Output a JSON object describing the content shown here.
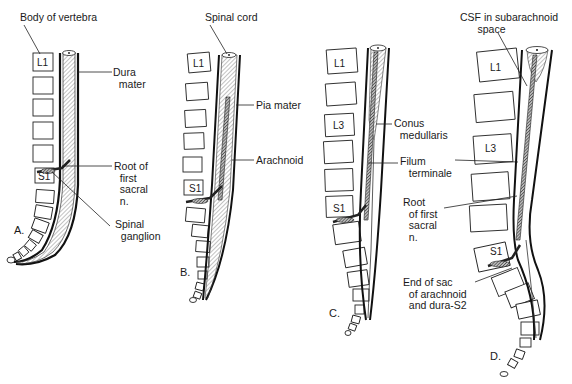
{
  "figure": {
    "panels": [
      {
        "id": "A",
        "letter": "A.",
        "labels": {
          "body_of_vertebra": "Body of vertebra",
          "dura_mater": "Dura\n  mater",
          "root_first_sacral": "Root of\n  first\n  sacral\n  n.",
          "spinal_ganglion": "Spinal\n  ganglion"
        },
        "vertebrae": {
          "top": "L1",
          "sacral": "S1"
        }
      },
      {
        "id": "B",
        "letter": "B.",
        "labels": {
          "spinal_cord": "Spinal cord",
          "pia_mater": "Pia mater",
          "arachnoid": "Arachnoid"
        },
        "vertebrae": {
          "top": "L1",
          "sacral": "S1"
        }
      },
      {
        "id": "C",
        "letter": "C.",
        "labels": {
          "conus_medullaris": "Conus\n  medullaris",
          "filum_terminale": "Filum\n   terminale"
        },
        "vertebrae": {
          "top": "L1",
          "mid": "L3",
          "sacral": "S1"
        }
      },
      {
        "id": "D",
        "letter": "D.",
        "labels": {
          "csf_subarachnoid": "CSF in subarachnoid\n      space",
          "root_first_sacral": "Root\n  of first\n  sacral\n  n.",
          "end_of_sac": "End of sac\n  of arachnoid\n  and dura-S2"
        },
        "vertebrae": {
          "top": "L1",
          "mid": "L3",
          "sacral": "S1"
        }
      }
    ],
    "colors": {
      "ink": "#1a1a1a",
      "background": "#ffffff",
      "hatch": "#555555"
    }
  }
}
